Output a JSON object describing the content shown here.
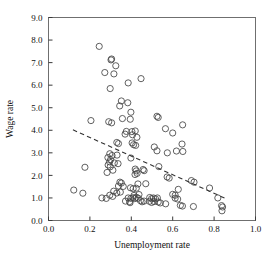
{
  "chart_data": {
    "type": "scatter",
    "title": "",
    "xlabel": "Unemployment rate",
    "ylabel": "Wage rate",
    "xlim": [
      0.0,
      1.0
    ],
    "ylim": [
      0.0,
      9.0
    ],
    "xticks": [
      "0.0",
      "0.2",
      "0.4",
      "0.6",
      "0.8",
      "1.0"
    ],
    "xtick_values": [
      0.0,
      0.2,
      0.4,
      0.6,
      0.8,
      1.0
    ],
    "yticks": [
      "0.0",
      "1.0",
      "2.0",
      "3.0",
      "4.0",
      "5.0",
      "6.0",
      "7.0",
      "8.0",
      "9.0"
    ],
    "ytick_values": [
      0.0,
      1.0,
      2.0,
      3.0,
      4.0,
      5.0,
      6.0,
      7.0,
      8.0,
      9.0
    ],
    "grid": false,
    "legend": null,
    "marker": "open-circle",
    "marker_color": "#444444",
    "marker_size": 3.1,
    "frame": true,
    "series": [
      {
        "name": "observations",
        "points": [
          [
            0.245,
            7.72
          ],
          [
            0.305,
            7.16
          ],
          [
            0.302,
            7.12
          ],
          [
            0.325,
            6.86
          ],
          [
            0.272,
            6.56
          ],
          [
            0.316,
            6.5
          ],
          [
            0.385,
            6.1
          ],
          [
            0.447,
            6.29
          ],
          [
            0.298,
            5.85
          ],
          [
            0.352,
            5.3
          ],
          [
            0.344,
            5.08
          ],
          [
            0.383,
            5.22
          ],
          [
            0.398,
            4.8
          ],
          [
            0.357,
            4.52
          ],
          [
            0.395,
            4.49
          ],
          [
            0.524,
            4.62
          ],
          [
            0.53,
            4.57
          ],
          [
            0.205,
            4.43
          ],
          [
            0.291,
            4.38
          ],
          [
            0.305,
            4.33
          ],
          [
            0.565,
            4.07
          ],
          [
            0.648,
            4.24
          ],
          [
            0.376,
            3.95
          ],
          [
            0.403,
            3.94
          ],
          [
            0.419,
            3.97
          ],
          [
            0.37,
            3.83
          ],
          [
            0.406,
            3.8
          ],
          [
            0.6,
            3.88
          ],
          [
            0.427,
            3.69
          ],
          [
            0.33,
            3.46
          ],
          [
            0.338,
            3.41
          ],
          [
            0.404,
            3.44
          ],
          [
            0.411,
            3.36
          ],
          [
            0.421,
            3.33
          ],
          [
            0.645,
            3.39
          ],
          [
            0.511,
            3.26
          ],
          [
            0.524,
            3.09
          ],
          [
            0.574,
            3.0
          ],
          [
            0.618,
            3.08
          ],
          [
            0.649,
            3.06
          ],
          [
            0.296,
            2.96
          ],
          [
            0.307,
            2.88
          ],
          [
            0.331,
            2.9
          ],
          [
            0.287,
            2.79
          ],
          [
            0.3,
            2.7
          ],
          [
            0.398,
            2.77
          ],
          [
            0.295,
            2.6
          ],
          [
            0.318,
            2.55
          ],
          [
            0.336,
            2.52
          ],
          [
            0.288,
            2.46
          ],
          [
            0.298,
            2.38
          ],
          [
            0.176,
            2.36
          ],
          [
            0.533,
            2.39
          ],
          [
            0.283,
            2.13
          ],
          [
            0.311,
            2.23
          ],
          [
            0.419,
            2.28
          ],
          [
            0.424,
            2.2
          ],
          [
            0.457,
            2.26
          ],
          [
            0.462,
            2.21
          ],
          [
            0.418,
            2.04
          ],
          [
            0.428,
            2.09
          ],
          [
            0.573,
            1.93
          ],
          [
            0.583,
            1.88
          ],
          [
            0.69,
            1.77
          ],
          [
            0.703,
            1.7
          ],
          [
            0.345,
            1.7
          ],
          [
            0.352,
            1.66
          ],
          [
            0.432,
            1.62
          ],
          [
            0.47,
            1.63
          ],
          [
            0.338,
            1.53
          ],
          [
            0.361,
            1.51
          ],
          [
            0.396,
            1.45
          ],
          [
            0.409,
            1.41
          ],
          [
            0.424,
            1.43
          ],
          [
            0.627,
            1.38
          ],
          [
            0.122,
            1.35
          ],
          [
            0.166,
            1.21
          ],
          [
            0.778,
            1.44
          ],
          [
            0.315,
            1.3
          ],
          [
            0.33,
            1.22
          ],
          [
            0.347,
            1.26
          ],
          [
            0.296,
            1.12
          ],
          [
            0.31,
            1.07
          ],
          [
            0.413,
            1.11
          ],
          [
            0.437,
            1.15
          ],
          [
            0.6,
            1.16
          ],
          [
            0.612,
            1.12
          ],
          [
            0.258,
            1.0
          ],
          [
            0.279,
            0.98
          ],
          [
            0.385,
            1.0
          ],
          [
            0.398,
            0.98
          ],
          [
            0.408,
            1.01
          ],
          [
            0.417,
            0.97
          ],
          [
            0.424,
            1.03
          ],
          [
            0.433,
            0.99
          ],
          [
            0.489,
            1.02
          ],
          [
            0.498,
            0.97
          ],
          [
            0.507,
            1.0
          ],
          [
            0.517,
            0.96
          ],
          [
            0.526,
            1.0
          ],
          [
            0.612,
            0.99
          ],
          [
            0.624,
            0.95
          ],
          [
            0.818,
            1.0
          ],
          [
            0.372,
            0.86
          ],
          [
            0.392,
            0.84
          ],
          [
            0.444,
            0.88
          ],
          [
            0.452,
            0.83
          ],
          [
            0.462,
            0.86
          ],
          [
            0.488,
            0.85
          ],
          [
            0.498,
            0.8
          ],
          [
            0.51,
            0.84
          ],
          [
            0.53,
            0.82
          ],
          [
            0.54,
            0.78
          ],
          [
            0.566,
            0.74
          ],
          [
            0.394,
            0.79
          ],
          [
            0.637,
            0.67
          ],
          [
            0.647,
            0.64
          ],
          [
            0.7,
            0.62
          ],
          [
            0.836,
            0.66
          ],
          [
            0.841,
            0.6
          ],
          [
            0.838,
            0.43
          ]
        ]
      }
    ],
    "trendline": {
      "style": "dashed",
      "color": "#333333",
      "x_start": 0.118,
      "y_start": 4.02,
      "x_end": 0.852,
      "y_end": 0.99
    }
  }
}
